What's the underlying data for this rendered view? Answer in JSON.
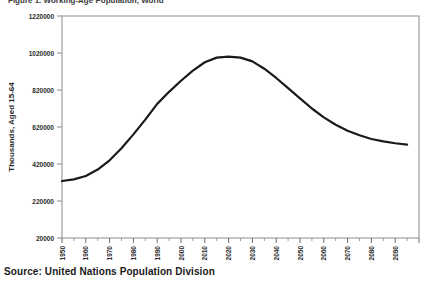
{
  "figure": {
    "title_clipped": "Figure 1. Working-Age Population, World",
    "source_note": "Source: United Nations Population Division"
  },
  "chart_data": {
    "type": "line",
    "title": "",
    "xlabel": "",
    "ylabel": "Thousands, Aged 15-64",
    "xlim": [
      1950,
      2100
    ],
    "ylim": [
      20000,
      1220000
    ],
    "ytick_labels": [
      "20000",
      "220000",
      "420000",
      "620000",
      "820000",
      "1020000",
      "1220000"
    ],
    "ytick_values": [
      20000,
      220000,
      420000,
      620000,
      820000,
      1020000,
      1220000
    ],
    "xtick_labels": [
      "1950",
      "1960",
      "1970",
      "1980",
      "1990",
      "2000",
      "2010",
      "2020",
      "2030",
      "2040",
      "2050",
      "2060",
      "2070",
      "2080",
      "2090"
    ],
    "xtick_values": [
      1950,
      1960,
      1970,
      1980,
      1990,
      2000,
      2010,
      2020,
      2030,
      2040,
      2050,
      2060,
      2070,
      2080,
      2090
    ],
    "x_minor_interval": 5,
    "grid": false,
    "legend": null,
    "line_color": "#1a1a1a",
    "line_width": 2.2,
    "series": [
      {
        "name": "Working-age population",
        "x": [
          1950,
          1955,
          1960,
          1965,
          1970,
          1975,
          1980,
          1985,
          1990,
          1995,
          2000,
          2005,
          2010,
          2015,
          2020,
          2025,
          2030,
          2035,
          2040,
          2045,
          2050,
          2055,
          2060,
          2065,
          2070,
          2075,
          2080,
          2085,
          2090,
          2095
        ],
        "values": [
          328000,
          337000,
          355000,
          390000,
          440000,
          505000,
          580000,
          660000,
          745000,
          810000,
          870000,
          925000,
          970000,
          995000,
          1000000,
          995000,
          975000,
          935000,
          885000,
          830000,
          775000,
          720000,
          672000,
          632000,
          600000,
          575000,
          555000,
          542000,
          532000,
          525000
        ]
      }
    ]
  },
  "icons": {
    "doc_icon": "document-icon"
  }
}
